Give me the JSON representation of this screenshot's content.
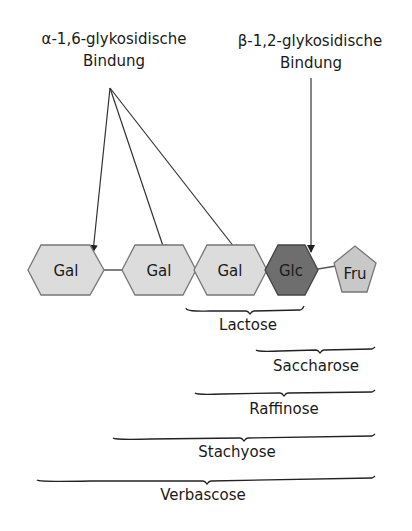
{
  "labels": {
    "alpha_bond_line1": "α-1,6-glykosidische",
    "alpha_bond_line2": "Bindung",
    "beta_bond_line1": "β-1,2-glykosidische",
    "beta_bond_line2": "Bindung"
  },
  "units": [
    {
      "name": "Gal",
      "shape": "hexagon",
      "fill": "#dcdcdc"
    },
    {
      "name": "Gal",
      "shape": "hexagon",
      "fill": "#dcdcdc"
    },
    {
      "name": "Gal",
      "shape": "hexagon",
      "fill": "#dcdcdc"
    },
    {
      "name": "Glc",
      "shape": "hexagon",
      "fill": "#6e6e6e"
    },
    {
      "name": "Fru",
      "shape": "pentagon",
      "fill": "#c8c8c8"
    }
  ],
  "sugars": [
    {
      "name": "Lactose",
      "span": "Gal-Glc"
    },
    {
      "name": "Saccharose",
      "span": "Glc-Fru"
    },
    {
      "name": "Raffinose",
      "span": "Gal-Glc-Fru"
    },
    {
      "name": "Stachyose",
      "span": "Gal-Gal-Glc-Fru"
    },
    {
      "name": "Verbascose",
      "span": "Gal-Gal-Gal-Glc-Fru"
    }
  ]
}
